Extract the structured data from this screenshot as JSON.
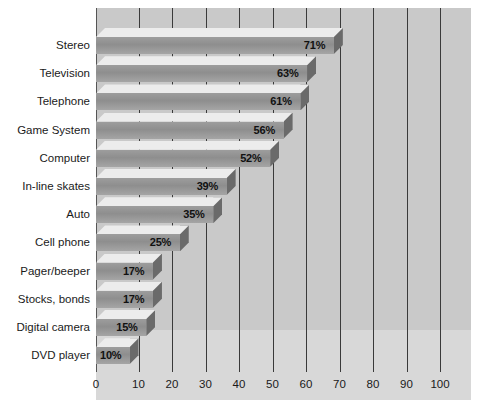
{
  "chart_data": {
    "type": "bar",
    "orientation": "horizontal",
    "title": "",
    "subtitle": "",
    "xlabel": "",
    "ylabel": "",
    "xlim": [
      0,
      100
    ],
    "xtick_step": 10,
    "xticks": [
      "0",
      "10",
      "20",
      "30",
      "40",
      "50",
      "60",
      "70",
      "80",
      "90",
      "100"
    ],
    "grid": true,
    "legend": false,
    "legend_position": "none",
    "value_suffix": "%",
    "categories": [
      "Stereo",
      "Television",
      "Telephone",
      "Game System",
      "Computer",
      "In-line skates",
      "Auto",
      "Cell phone",
      "Pager/beeper",
      "Stocks, bonds",
      "Digital camera",
      "DVD player"
    ],
    "values": [
      71,
      63,
      61,
      56,
      52,
      39,
      35,
      25,
      17,
      17,
      15,
      10
    ],
    "data_labels": [
      "71%",
      "63%",
      "61%",
      "56%",
      "52%",
      "39%",
      "35%",
      "25%",
      "17%",
      "17%",
      "15%",
      "10%"
    ]
  },
  "style": {
    "panel_background": "#c9c9c9",
    "panel_background_lower": "#d8d8d8",
    "bar_front": "#8e8e8e",
    "bar_top": "#ececec",
    "bar_side": "#6a6a6a",
    "gridline": "#3a3a3a",
    "text": "#1a1a1a",
    "page_background": "#ffffff"
  }
}
